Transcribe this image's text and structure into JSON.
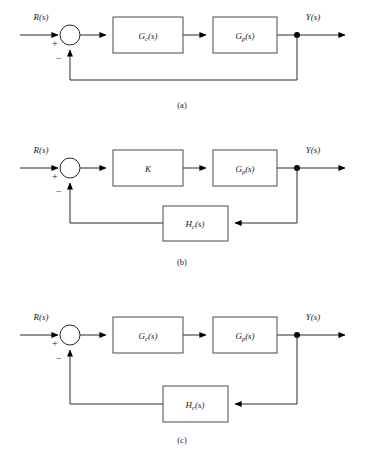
{
  "figure": {
    "background_color": "#ffffff",
    "line_color": "#2a2a2a",
    "box_border_color": "#4a4a4a",
    "width": 365,
    "height": 450
  },
  "signals": {
    "input_label_base": "R",
    "input_label_arg": "(s)",
    "output_label_base": "Y",
    "output_label_arg": "(s)",
    "plus_sign": "+",
    "minus_sign": "−"
  },
  "diagrams": [
    {
      "id": "a",
      "caption": "(a)",
      "input_label": "R(s)",
      "output_label": "Y(s)",
      "forward_blocks": [
        {
          "base": "G",
          "sub": "c",
          "arg": "(s)",
          "text": "Gc(s)"
        },
        {
          "base": "G",
          "sub": "p",
          "arg": "(s)",
          "text": "Gp(s)"
        }
      ],
      "feedback_block": null,
      "feedback_type": "unity"
    },
    {
      "id": "b",
      "caption": "(b)",
      "input_label": "R(s)",
      "output_label": "Y(s)",
      "forward_blocks": [
        {
          "base": "K",
          "sub": "",
          "arg": "",
          "text": "K"
        },
        {
          "base": "G",
          "sub": "p",
          "arg": "(s)",
          "text": "Gp(s)"
        }
      ],
      "feedback_block": {
        "base": "H",
        "sub": "c",
        "arg": "(s)",
        "text": "Hc(s)"
      },
      "feedback_type": "block"
    },
    {
      "id": "c",
      "caption": "(c)",
      "input_label": "R(s)",
      "output_label": "Y(s)",
      "forward_blocks": [
        {
          "base": "G",
          "sub": "c",
          "arg": "(s)",
          "text": "Gc(s)"
        },
        {
          "base": "G",
          "sub": "p",
          "arg": "(s)",
          "text": "Gp(s)"
        }
      ],
      "feedback_block": {
        "base": "H",
        "sub": "c",
        "arg": "(s)",
        "text": "Hc(s)"
      },
      "feedback_type": "block"
    }
  ]
}
